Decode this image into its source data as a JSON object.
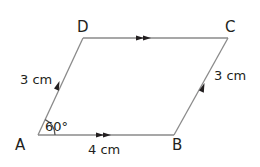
{
  "figure": {
    "shape": "parallelogram",
    "colors": {
      "line": "#8a8a8a",
      "text": "#231f20",
      "arrow": "#231f20"
    },
    "vertices": {
      "A": {
        "label": "A",
        "x": 38,
        "y": 135
      },
      "B": {
        "label": "B",
        "x": 174,
        "y": 135
      },
      "C": {
        "label": "C",
        "x": 228,
        "y": 38
      },
      "D": {
        "label": "D",
        "x": 83,
        "y": 38
      }
    },
    "sides": {
      "AD": {
        "label": "3 cm",
        "arrows": 1
      },
      "BC": {
        "label": "3 cm",
        "arrows": 1
      },
      "AB": {
        "label": "4 cm",
        "arrows": 2
      },
      "DC": {
        "label": "",
        "arrows": 2
      }
    },
    "angle": {
      "label": "60°",
      "at": "A"
    }
  }
}
